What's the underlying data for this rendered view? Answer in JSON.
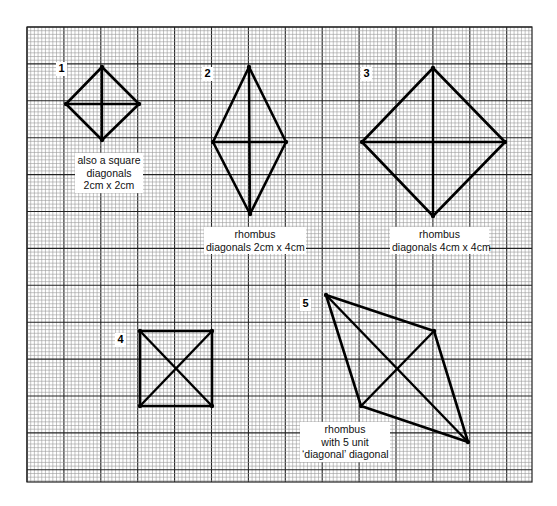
{
  "grid": {
    "x0": 27,
    "y0": 27,
    "x1": 532,
    "y1": 482,
    "major_spacing": 36.9,
    "minor_divisions": 10,
    "minor_color": "#9a9a9a",
    "major_color": "#222222"
  },
  "figures": [
    {
      "number": "1",
      "number_pos": [
        56,
        62
      ],
      "vertices": [
        [
          102,
          67
        ],
        [
          139,
          104
        ],
        [
          102,
          140
        ],
        [
          66,
          104
        ]
      ],
      "diagonals": [
        [
          [
            102,
            67
          ],
          [
            102,
            140
          ]
        ],
        [
          [
            66,
            104
          ],
          [
            139,
            104
          ]
        ]
      ],
      "label_lines": [
        "also a square",
        "diagonals",
        "2cm x 2cm"
      ],
      "label_box": [
        75,
        153,
        64
      ]
    },
    {
      "number": "2",
      "number_pos": [
        202,
        67
      ],
      "vertices": [
        [
          249,
          67
        ],
        [
          286,
          142
        ],
        [
          250,
          214
        ],
        [
          213,
          142
        ]
      ],
      "diagonals": [
        [
          [
            249,
            67
          ],
          [
            250,
            214
          ]
        ],
        [
          [
            213,
            142
          ],
          [
            286,
            142
          ]
        ]
      ],
      "label_lines": [
        "rhombus",
        "diagonals 2cm x 4cm"
      ],
      "label_box": [
        204,
        227,
        98
      ]
    },
    {
      "number": "3",
      "number_pos": [
        361,
        67
      ],
      "vertices": [
        [
          433,
          68
        ],
        [
          505,
          142
        ],
        [
          433,
          216
        ],
        [
          362,
          142
        ]
      ],
      "diagonals": [
        [
          [
            433,
            68
          ],
          [
            433,
            216
          ]
        ],
        [
          [
            362,
            142
          ],
          [
            505,
            142
          ]
        ]
      ],
      "label_lines": [
        "rhombus",
        "diagonals 4cm x 4cm"
      ],
      "label_box": [
        390,
        227,
        95
      ]
    },
    {
      "number": "4",
      "number_pos": [
        115,
        333
      ],
      "vertices": [
        [
          140,
          331
        ],
        [
          212,
          331
        ],
        [
          212,
          406
        ],
        [
          140,
          406
        ]
      ],
      "diagonals": [
        [
          [
            140,
            331
          ],
          [
            212,
            406
          ]
        ],
        [
          [
            212,
            331
          ],
          [
            140,
            406
          ]
        ]
      ],
      "label_lines": [],
      "label_box": null
    },
    {
      "number": "5",
      "number_pos": [
        300,
        297
      ],
      "vertices": [
        [
          326,
          295
        ],
        [
          434,
          331
        ],
        [
          468,
          442
        ],
        [
          361,
          406
        ]
      ],
      "diagonals": [
        [
          [
            326,
            295
          ],
          [
            468,
            442
          ]
        ],
        [
          [
            434,
            331
          ],
          [
            361,
            406
          ]
        ]
      ],
      "label_lines": [
        "rhombus",
        "with 5 unit",
        "‘diagonal’ diagonal"
      ],
      "label_box": [
        300,
        422,
        86
      ]
    }
  ]
}
